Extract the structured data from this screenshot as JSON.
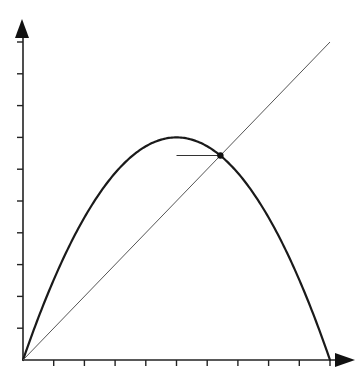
{
  "chart_data": {
    "type": "line",
    "title": "",
    "xlabel": "",
    "ylabel": "",
    "xlim": [
      0,
      10
    ],
    "ylim": [
      0,
      10
    ],
    "x_ticks": [
      0,
      1,
      2,
      3,
      4,
      5,
      6,
      7,
      8,
      9,
      10
    ],
    "y_ticks": [
      0,
      1,
      2,
      3,
      4,
      5,
      6,
      7,
      8,
      9,
      10
    ],
    "tick_labels_shown": false,
    "grid": false,
    "legend": null,
    "series": [
      {
        "name": "parabola f(x) = 0.28·x·(10−x)",
        "style": "thick-black",
        "x": [
          0,
          0.5,
          1,
          1.5,
          2,
          2.5,
          3,
          3.5,
          4,
          4.5,
          5,
          5.5,
          6,
          6.5,
          7,
          7.5,
          8,
          8.5,
          9,
          9.5,
          10
        ],
        "y": [
          0,
          1.33,
          2.52,
          3.57,
          4.48,
          5.25,
          5.88,
          6.37,
          6.72,
          6.93,
          7.0,
          6.93,
          6.72,
          6.37,
          5.88,
          5.25,
          4.48,
          3.57,
          2.52,
          1.33,
          0
        ]
      },
      {
        "name": "diagonal y = x",
        "style": "thin-gray",
        "x": [
          0,
          10
        ],
        "y": [
          0,
          10
        ]
      }
    ],
    "annotations": [
      {
        "type": "point",
        "label": "fixed point (intersection)",
        "x": 6.43,
        "y": 6.43
      },
      {
        "type": "horizontal-segment",
        "x_from": 5.0,
        "x_to": 6.43,
        "y": 6.43
      }
    ]
  },
  "layout": {
    "origin_px": [
      23,
      360
    ],
    "x_unit_px": 30.7,
    "y_unit_px": 31.8,
    "x_axis_end_px": 355,
    "y_axis_end_px": 19
  },
  "a11y": {
    "title": "Parabola and diagonal line intersecting at a fixed point"
  }
}
